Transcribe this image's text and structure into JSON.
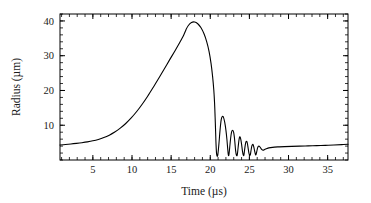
{
  "chart_data": {
    "type": "line",
    "title": "",
    "subtitle": "",
    "xlabel": "Time  (µs)",
    "ylabel": "Radius  (µm)",
    "xlim": [
      0.8,
      37.6
    ],
    "ylim": [
      0.0,
      42.0
    ],
    "xticks": [
      5,
      10,
      15,
      20,
      25,
      30,
      35
    ],
    "xtick_labels": [
      "5",
      "10",
      "15",
      "20",
      "25",
      "30",
      "35"
    ],
    "yticks": [
      10,
      20,
      30,
      40
    ],
    "ytick_labels": [
      "10",
      "20",
      "30",
      "40"
    ],
    "x_minor_tick_step": 1,
    "y_minor_tick_step": 2,
    "grid": false,
    "legend": null,
    "legend_position": "none",
    "line_color": "#000000",
    "line_width": 1.1,
    "frame_color": "#000000",
    "background_color": "#ffffff",
    "annotations": [],
    "series": [
      {
        "name": "bubble radius",
        "x": [
          0.8,
          1.5,
          2.2,
          2.9,
          3.6,
          4.3,
          5.0,
          5.7,
          6.4,
          7.1,
          7.8,
          8.5,
          9.2,
          9.9,
          10.6,
          11.3,
          12.0,
          12.7,
          13.4,
          14.1,
          14.8,
          15.5,
          16.1,
          16.6,
          16.9,
          17.2,
          17.6,
          18.0,
          18.4,
          18.8,
          19.2,
          19.55,
          19.85,
          20.1,
          20.3,
          20.45,
          20.55,
          20.62,
          20.68,
          20.74,
          20.82,
          20.95,
          21.1,
          21.25,
          21.4,
          21.55,
          21.7,
          21.85,
          22.0,
          22.12,
          22.22,
          22.3,
          22.38,
          22.48,
          22.6,
          22.72,
          22.85,
          22.98,
          23.08,
          23.16,
          23.24,
          23.34,
          23.45,
          23.56,
          23.66,
          23.74,
          23.82,
          23.92,
          24.02,
          24.12,
          24.22,
          24.3,
          24.38,
          24.48,
          24.58,
          24.68,
          24.76,
          24.84,
          24.94,
          25.04,
          25.12,
          25.2,
          25.3,
          25.4,
          25.48,
          25.56,
          25.66,
          25.76,
          25.84,
          25.94,
          26.04,
          26.14,
          26.26,
          26.4,
          26.55,
          26.75,
          27.0,
          27.3,
          27.7,
          28.2,
          28.8,
          29.5,
          30.4,
          31.4,
          32.5,
          33.6,
          34.7,
          35.8,
          36.8,
          37.6
        ],
        "y": [
          4.3,
          4.45,
          4.6,
          4.78,
          4.98,
          5.22,
          5.52,
          5.92,
          6.45,
          7.15,
          8.05,
          9.15,
          10.5,
          12.1,
          13.95,
          16.05,
          18.35,
          20.85,
          23.45,
          26.1,
          28.8,
          31.45,
          33.8,
          35.9,
          37.5,
          38.7,
          39.55,
          39.7,
          39.2,
          38.1,
          36.3,
          34.0,
          31.2,
          27.8,
          24.0,
          20.2,
          16.4,
          12.4,
          8.4,
          4.4,
          1.6,
          1.3,
          4.5,
          8.6,
          11.6,
          12.55,
          12.2,
          10.8,
          8.6,
          6.1,
          3.5,
          1.6,
          1.45,
          3.5,
          6.2,
          8.0,
          8.55,
          8.0,
          6.6,
          4.7,
          2.7,
          1.45,
          1.45,
          3.6,
          5.6,
          6.55,
          6.6,
          5.7,
          4.2,
          2.5,
          1.4,
          1.4,
          2.8,
          4.4,
          5.3,
          5.3,
          4.6,
          3.4,
          2.0,
          1.4,
          1.5,
          2.6,
          3.9,
          4.45,
          4.4,
          3.8,
          2.7,
          1.7,
          1.5,
          2.4,
          3.4,
          3.9,
          3.95,
          3.6,
          3.1,
          2.8,
          3.1,
          3.35,
          3.55,
          3.7,
          3.78,
          3.85,
          3.92,
          3.99,
          4.06,
          4.14,
          4.22,
          4.32,
          4.42,
          4.52
        ]
      }
    ]
  },
  "figure": {
    "plot_left_px": 60,
    "plot_right_px": 348,
    "plot_top_px": 14,
    "plot_bottom_px": 160
  }
}
